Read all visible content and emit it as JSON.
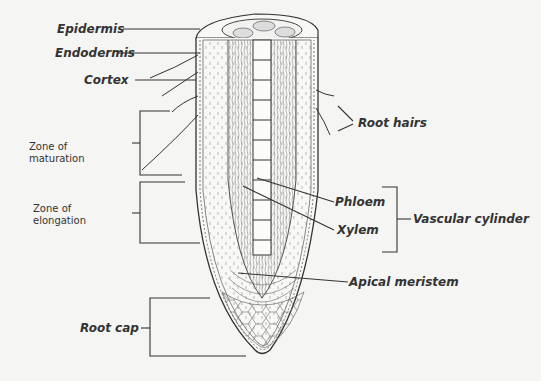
{
  "diagram": {
    "type": "anatomical-illustration",
    "colors": {
      "background": "#f5f5f4",
      "line": "#333333",
      "text": "#333333"
    },
    "labels": {
      "epidermis": "Epidermis",
      "endodermis": "Endodermis",
      "cortex": "Cortex",
      "root_hairs": "Root hairs",
      "zone_maturation_line1": "Zone of",
      "zone_maturation_line2": "maturation",
      "zone_elongation_line1": "Zone of",
      "zone_elongation_line2": "elongation",
      "phloem": "Phloem",
      "xylem": "Xylem",
      "vascular_cylinder": "Vascular cylinder",
      "apical_meristem": "Apical meristem",
      "root_cap": "Root cap"
    }
  }
}
